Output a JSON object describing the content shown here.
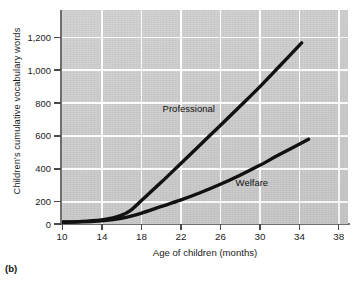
{
  "figure": {
    "caption": "(b)",
    "background_color": "#cbcbcb",
    "gridline_color": "#fdfdfd",
    "line_color": "#111111"
  },
  "chart_data": {
    "type": "line",
    "title": "",
    "xlabel": "Age of children (months)",
    "ylabel": "Children's cumulative vocabulary words",
    "xlim": [
      10,
      39
    ],
    "ylim": [
      0,
      1300
    ],
    "xticks": [
      10,
      14,
      18,
      22,
      26,
      30,
      34,
      38
    ],
    "xtick_labels": [
      "10",
      "14",
      "18",
      "22",
      "26",
      "30",
      "34",
      "38"
    ],
    "yticks": [
      0,
      200,
      400,
      600,
      800,
      1000,
      1200
    ],
    "ytick_labels": [
      "0",
      "200",
      "400",
      "600",
      "800",
      "1,000",
      "1,200"
    ],
    "grid": true,
    "legend_position": "inline-annotation",
    "series": [
      {
        "name": "Professional",
        "label": "Professional",
        "label_x": 20.2,
        "label_y": 700,
        "x": [
          10,
          12,
          14,
          15,
          16,
          17,
          18,
          20,
          22,
          24,
          26,
          28,
          30,
          32,
          34.3
        ],
        "y": [
          12,
          16,
          25,
          35,
          52,
          85,
          140,
          250,
          365,
          480,
          595,
          712,
          830,
          955,
          1100
        ]
      },
      {
        "name": "Welfare",
        "label": "Welfare",
        "label_x": 27.6,
        "label_y": 250,
        "x": [
          10,
          12,
          14,
          15,
          16,
          17,
          18,
          20,
          22,
          24,
          26,
          28,
          30,
          32,
          35
        ],
        "y": [
          10,
          13,
          20,
          26,
          35,
          48,
          65,
          105,
          145,
          190,
          240,
          295,
          355,
          420,
          515
        ]
      }
    ]
  }
}
